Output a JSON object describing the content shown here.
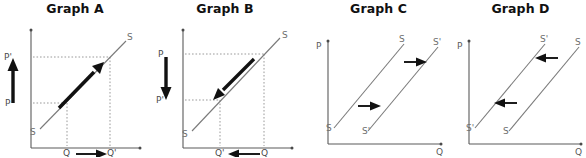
{
  "figure": {
    "background_color": "#ffffff",
    "line_color": "#7a7a7a",
    "axis_color": "#5a5a5a",
    "arrow_color": "#111111",
    "label_color": "#6d6d6d"
  },
  "panels": [
    {
      "id": "a",
      "title": "Graph A",
      "description": "Movement along the supply curve upward: price rises from P to P', quantity rises from Q to Q'",
      "axis_y_label": "",
      "axis_x_label": "",
      "curve_labels": {
        "lower_left": "S",
        "upper_right": "S"
      },
      "price_labels": {
        "upper": "P'",
        "lower": "P"
      },
      "quantity_labels": {
        "left": "Q",
        "right": "Q'"
      },
      "price_arrow_direction": "up",
      "quantity_arrow_direction": "right",
      "movement_arrow_direction": "up-right"
    },
    {
      "id": "b",
      "title": "Graph B",
      "description": "Movement along the supply curve downward: price falls from P to P', quantity falls from Q to Q'",
      "axis_y_label": "",
      "axis_x_label": "",
      "curve_labels": {
        "lower_left": "S",
        "upper_right": "S"
      },
      "price_labels": {
        "upper": "P",
        "lower": "P'"
      },
      "quantity_labels": {
        "left": "Q'",
        "right": "Q"
      },
      "price_arrow_direction": "down",
      "quantity_arrow_direction": "left",
      "movement_arrow_direction": "down-left"
    },
    {
      "id": "c",
      "title": "Graph C",
      "description": "Rightward shift of the supply curve from S to S'",
      "axis_y_label": "P",
      "axis_x_label": "Q",
      "curve_labels": {
        "left_line_bottom": "S",
        "left_line_top": "S",
        "right_line_bottom": "S'",
        "right_line_top": "S'"
      },
      "shift_arrow_direction": "right",
      "shift_arrow_count": 2
    },
    {
      "id": "d",
      "title": "Graph D",
      "description": "Leftward shift of the supply curve from S to S'",
      "axis_y_label": "P",
      "axis_x_label": "Q",
      "curve_labels": {
        "left_line_bottom": "S'",
        "left_line_top": "S'",
        "right_line_bottom": "S",
        "right_line_top": "S"
      },
      "shift_arrow_direction": "left",
      "shift_arrow_count": 2
    }
  ]
}
